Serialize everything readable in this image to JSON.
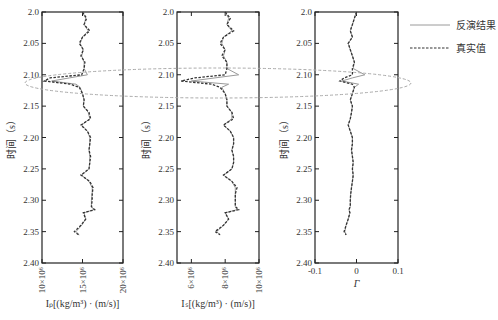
{
  "chart_data": {
    "type": "line",
    "title": "",
    "legend": {
      "position": "top-right",
      "entries": [
        {
          "label": "反演结果",
          "style": "solid",
          "color": "#9a9a9a"
        },
        {
          "label": "真实值",
          "style": "dashed",
          "color": "#333333"
        }
      ]
    },
    "shared_y": {
      "label": "时间（s）",
      "range": [
        2.0,
        2.4
      ],
      "inverted": true,
      "ticks": [
        "2.0",
        "2.05",
        "2.10",
        "2.15",
        "2.20",
        "2.25",
        "2.30",
        "2.35",
        "2.40"
      ]
    },
    "highlight": {
      "shape": "dashed-ellipse",
      "time_range": [
        2.085,
        2.125
      ],
      "color": "#aaaaaa"
    },
    "panels": [
      {
        "id": "Ip",
        "xlabel": "Iₚ[(kg/m³) · (m/s)]",
        "xlim": [
          10,
          20
        ],
        "x_unit_scale": "×10^6",
        "xticks": [
          {
            "v": 10,
            "label": "10×10⁶"
          },
          {
            "v": 15,
            "label": "15×10⁶"
          },
          {
            "v": 20,
            "label": "20×10⁶"
          }
        ],
        "t": [
          2.0,
          2.01,
          2.02,
          2.03,
          2.04,
          2.05,
          2.06,
          2.07,
          2.08,
          2.09,
          2.1,
          2.105,
          2.11,
          2.115,
          2.12,
          2.13,
          2.14,
          2.15,
          2.16,
          2.17,
          2.18,
          2.19,
          2.2,
          2.21,
          2.22,
          2.23,
          2.24,
          2.25,
          2.26,
          2.27,
          2.28,
          2.29,
          2.3,
          2.31,
          2.315,
          2.32,
          2.33,
          2.34,
          2.35,
          2.355
        ],
        "true": [
          15.0,
          15.5,
          15.2,
          15.9,
          15.0,
          14.6,
          15.1,
          14.8,
          15.3,
          15.2,
          14.9,
          11.0,
          10.3,
          13.5,
          14.6,
          15.0,
          15.2,
          15.1,
          15.8,
          16.0,
          14.8,
          15.6,
          16.0,
          15.9,
          15.8,
          16.0,
          15.9,
          15.8,
          14.8,
          15.9,
          16.3,
          16.2,
          16.2,
          16.1,
          16.5,
          15.1,
          15.4,
          14.8,
          14.0,
          14.5
        ],
        "inverted": [
          15.0,
          15.4,
          15.2,
          15.7,
          15.0,
          14.7,
          15.1,
          14.9,
          15.2,
          15.2,
          15.6,
          13.4,
          11.2,
          14.2,
          14.7,
          15.0,
          15.2,
          15.1,
          15.7,
          15.9,
          14.9,
          15.6,
          15.9,
          15.9,
          15.8,
          15.9,
          15.9,
          15.8,
          14.9,
          15.8,
          16.2,
          16.2,
          16.1,
          16.1,
          16.4,
          15.2,
          15.4,
          14.9,
          14.2,
          14.6
        ]
      },
      {
        "id": "Is",
        "xlabel": "Iₛ[(kg/m³) · (m/s)]",
        "xlim": [
          5.15,
          10
        ],
        "x_unit_scale": "×10^6",
        "xticks": [
          {
            "v": 6,
            "label": "6×10⁶"
          },
          {
            "v": 8,
            "label": "8×10⁶"
          },
          {
            "v": 10,
            "label": "10×10⁶"
          }
        ],
        "t": [
          2.0,
          2.01,
          2.02,
          2.03,
          2.04,
          2.05,
          2.06,
          2.07,
          2.08,
          2.09,
          2.1,
          2.105,
          2.11,
          2.115,
          2.12,
          2.13,
          2.14,
          2.15,
          2.16,
          2.17,
          2.18,
          2.19,
          2.2,
          2.21,
          2.22,
          2.23,
          2.24,
          2.25,
          2.26,
          2.27,
          2.28,
          2.29,
          2.3,
          2.31,
          2.315,
          2.32,
          2.33,
          2.34,
          2.35,
          2.355
        ],
        "true": [
          8.0,
          8.3,
          8.1,
          8.5,
          7.9,
          7.7,
          8.0,
          7.8,
          8.1,
          8.1,
          8.0,
          6.2,
          5.4,
          7.2,
          7.7,
          8.0,
          8.1,
          8.1,
          8.4,
          8.5,
          7.9,
          8.3,
          8.5,
          8.5,
          8.4,
          8.5,
          8.5,
          8.4,
          7.9,
          8.4,
          8.7,
          8.6,
          8.6,
          8.6,
          8.8,
          8.0,
          8.2,
          7.9,
          7.4,
          7.7
        ],
        "inverted": [
          8.0,
          8.2,
          8.1,
          8.4,
          7.9,
          7.8,
          8.0,
          7.9,
          8.1,
          8.1,
          8.8,
          7.4,
          6.0,
          8.2,
          7.8,
          8.0,
          8.1,
          8.1,
          8.4,
          8.4,
          7.9,
          8.3,
          8.5,
          8.5,
          8.4,
          8.5,
          8.5,
          8.4,
          7.9,
          8.4,
          8.6,
          8.6,
          8.6,
          8.6,
          8.7,
          8.0,
          8.2,
          7.9,
          7.5,
          7.7
        ]
      },
      {
        "id": "Gamma",
        "xlabel": "Γ",
        "xlim": [
          -0.1,
          0.1
        ],
        "x_unit_scale": "",
        "xticks": [
          {
            "v": -0.1,
            "label": "-0.1"
          },
          {
            "v": 0,
            "label": "0"
          },
          {
            "v": 0.1,
            "label": "0.1"
          }
        ],
        "t": [
          2.0,
          2.01,
          2.02,
          2.03,
          2.04,
          2.05,
          2.06,
          2.07,
          2.08,
          2.09,
          2.1,
          2.105,
          2.11,
          2.115,
          2.12,
          2.13,
          2.14,
          2.15,
          2.16,
          2.17,
          2.18,
          2.19,
          2.2,
          2.21,
          2.22,
          2.23,
          2.24,
          2.25,
          2.26,
          2.27,
          2.28,
          2.29,
          2.3,
          2.31,
          2.315,
          2.32,
          2.33,
          2.34,
          2.35,
          2.355
        ],
        "true": [
          0.0,
          -0.005,
          -0.01,
          -0.015,
          -0.01,
          -0.02,
          -0.015,
          -0.01,
          -0.005,
          -0.01,
          -0.01,
          -0.03,
          -0.04,
          -0.01,
          -0.005,
          -0.01,
          -0.015,
          -0.01,
          -0.012,
          -0.015,
          -0.02,
          -0.015,
          -0.01,
          -0.01,
          -0.012,
          -0.01,
          -0.008,
          -0.01,
          -0.008,
          -0.01,
          -0.012,
          -0.014,
          -0.015,
          -0.015,
          -0.018,
          -0.016,
          -0.02,
          -0.025,
          -0.03,
          -0.025
        ],
        "inverted": [
          0.0,
          -0.005,
          -0.01,
          -0.015,
          -0.01,
          -0.02,
          -0.015,
          -0.01,
          -0.005,
          -0.008,
          0.02,
          -0.01,
          -0.035,
          0.005,
          -0.005,
          -0.01,
          -0.015,
          -0.01,
          -0.012,
          -0.015,
          -0.02,
          -0.015,
          -0.01,
          -0.01,
          -0.012,
          -0.01,
          -0.008,
          -0.01,
          -0.008,
          -0.01,
          -0.012,
          -0.014,
          -0.015,
          -0.015,
          -0.018,
          -0.016,
          -0.02,
          -0.025,
          -0.028,
          -0.025
        ]
      }
    ]
  },
  "layout": {
    "panels_px": [
      {
        "x0": 42,
        "x1": 123
      },
      {
        "x0": 177,
        "x1": 259
      },
      {
        "x0": 315,
        "x1": 398
      }
    ],
    "y0_px": 12,
    "y1_px": 263,
    "ellipse_px": {
      "cx": 218,
      "cy": 83,
      "rx": 193,
      "ry": 15
    }
  }
}
